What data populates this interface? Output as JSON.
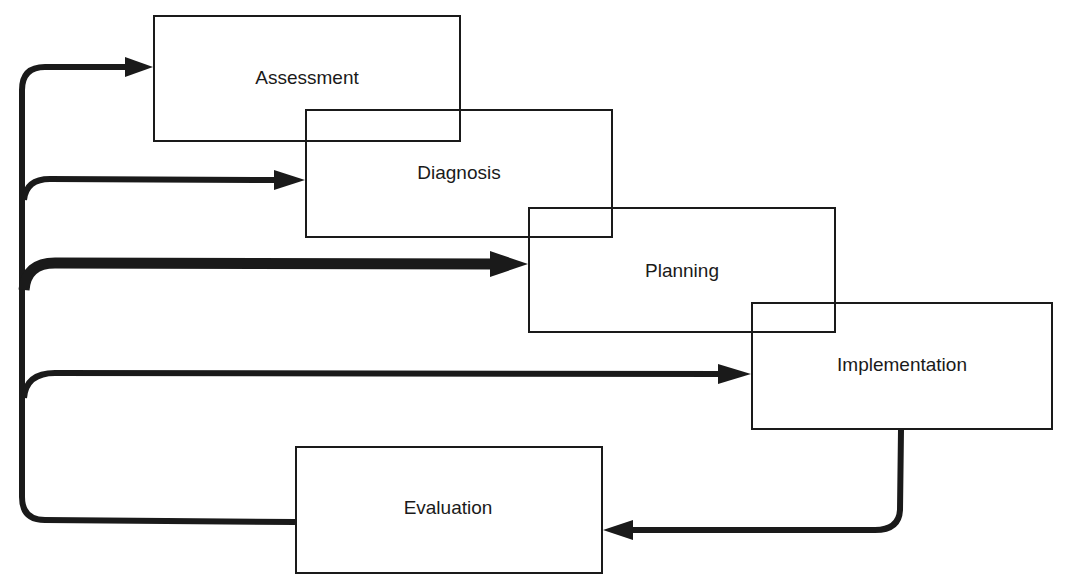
{
  "diagram": {
    "type": "process-cycle",
    "colors": {
      "stroke": "#1a1a1a",
      "background": "#ffffff"
    },
    "boxes": [
      {
        "id": "assessment",
        "label": "Assessment",
        "x": 153,
        "y": 15,
        "w": 308,
        "h": 127,
        "label_x": 307,
        "label_y": 78
      },
      {
        "id": "diagnosis",
        "label": "Diagnosis",
        "x": 305,
        "y": 109,
        "w": 308,
        "h": 129,
        "label_x": 459,
        "label_y": 173
      },
      {
        "id": "planning",
        "label": "Planning",
        "x": 528,
        "y": 207,
        "w": 308,
        "h": 126,
        "label_x": 682,
        "label_y": 271
      },
      {
        "id": "implementation",
        "label": "Implementation",
        "x": 751,
        "y": 302,
        "w": 302,
        "h": 128,
        "label_x": 902,
        "label_y": 365
      },
      {
        "id": "evaluation",
        "label": "Evaluation",
        "x": 295,
        "y": 446,
        "w": 308,
        "h": 128,
        "label_x": 448,
        "label_y": 508
      }
    ],
    "arrows": [
      {
        "from": "evaluation",
        "to": "assessment",
        "width": 6,
        "path": "M 295 522 L 45 520 Q 22 520 22 497 L 22 90 Q 22 67 45 67 L 130 67",
        "head": [
          [
            153,
            67
          ],
          [
            125,
            57
          ],
          [
            125,
            77
          ]
        ]
      },
      {
        "from": "evaluation",
        "to": "diagnosis",
        "width": 6,
        "path": "M 24 200 Q 26 179 50 179 L 280 180",
        "head": [
          [
            305,
            180
          ],
          [
            274,
            170
          ],
          [
            274,
            190
          ]
        ]
      },
      {
        "from": "evaluation",
        "to": "planning",
        "width": 11,
        "path": "M 24 290 Q 26 263 55 263 L 500 264",
        "head": [
          [
            528,
            264
          ],
          [
            490,
            251
          ],
          [
            490,
            277
          ]
        ]
      },
      {
        "from": "evaluation",
        "to": "implementation",
        "width": 6,
        "path": "M 24 398 Q 26 373 55 373 L 725 374",
        "head": [
          [
            751,
            374
          ],
          [
            718,
            364
          ],
          [
            718,
            384
          ]
        ]
      },
      {
        "from": "implementation",
        "to": "evaluation",
        "width": 6,
        "path": "M 901 430 L 900 510 Q 899 530 875 530 L 630 530",
        "head": [
          [
            603,
            530
          ],
          [
            633,
            520
          ],
          [
            633,
            540
          ]
        ]
      }
    ]
  }
}
